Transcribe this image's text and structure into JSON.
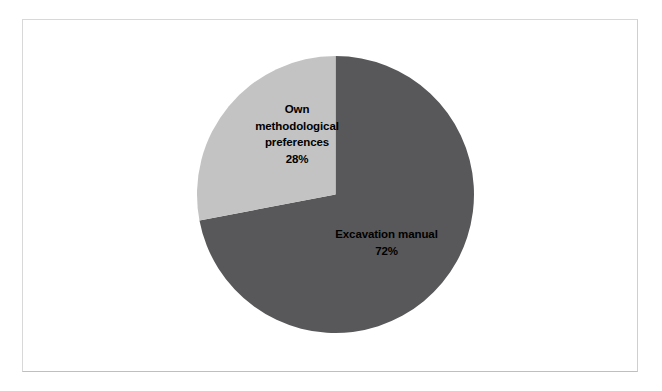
{
  "figure": {
    "background_color": "#ffffff",
    "frame_color": "#d8d8d8"
  },
  "chart_data": {
    "type": "pie",
    "title": "",
    "subtitle": "",
    "xlabel": "",
    "ylabel": "",
    "legend_position": "none",
    "grid": false,
    "labels_inside": true,
    "start_angle_deg": 0,
    "direction": "clockwise",
    "categories": [
      "Excavation manual",
      "Own methodological preferences"
    ],
    "values": [
      72,
      28
    ],
    "value_unit": "%",
    "colors": [
      "#58585a",
      "#c3c3c3"
    ],
    "slices": [
      {
        "name": "Excavation manual",
        "value": 72,
        "percent_text": "72%",
        "color": "#58585a",
        "label_lines": [
          "Excavation manual"
        ]
      },
      {
        "name": "Own methodological preferences",
        "value": 28,
        "percent_text": "28%",
        "color": "#c3c3c3",
        "label_lines": [
          "Own",
          "methodological",
          "preferences"
        ]
      }
    ]
  },
  "labels": {
    "own": {
      "line1": "Own",
      "line2": "methodological",
      "line3": "preferences",
      "percent": "28%"
    },
    "excavation": {
      "line1": "Excavation manual",
      "percent": "72%"
    }
  }
}
